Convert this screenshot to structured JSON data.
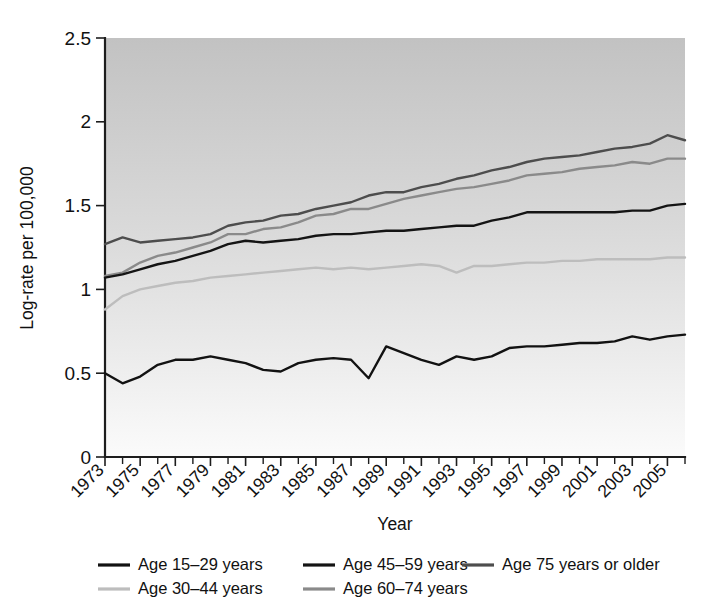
{
  "chart_data": {
    "type": "line",
    "title": "",
    "xlabel": "Year",
    "ylabel": "Log-rate per 100,000",
    "xlim": [
      1973,
      2006
    ],
    "ylim": [
      0,
      2.5
    ],
    "yticks": [
      "0",
      "0.5",
      "1",
      "1.5",
      "2",
      "2.5"
    ],
    "ytick_values": [
      0,
      0.5,
      1,
      1.5,
      2,
      2.5
    ],
    "xticks": [
      "1973",
      "1975",
      "1977",
      "1979",
      "1981",
      "1983",
      "1985",
      "1987",
      "1989",
      "1991",
      "1993",
      "1995",
      "1997",
      "1999",
      "2001",
      "2003",
      "2005"
    ],
    "xtick_values": [
      1973,
      1975,
      1977,
      1979,
      1981,
      1983,
      1985,
      1987,
      1989,
      1991,
      1993,
      1995,
      1997,
      1999,
      2001,
      2003,
      2005
    ],
    "minor_tick_interval": 1,
    "grid": false,
    "legend_position": "bottom",
    "plot_background": "vertical-gradient-gray-to-white",
    "x": [
      1973,
      1974,
      1975,
      1976,
      1977,
      1978,
      1979,
      1980,
      1981,
      1982,
      1983,
      1984,
      1985,
      1986,
      1987,
      1988,
      1989,
      1990,
      1991,
      1992,
      1993,
      1994,
      1995,
      1996,
      1997,
      1998,
      1999,
      2000,
      2001,
      2002,
      2003,
      2004,
      2005,
      2006
    ],
    "series": [
      {
        "name": "Age 15–29 years",
        "color": "#121212",
        "values": [
          0.5,
          0.44,
          0.48,
          0.55,
          0.58,
          0.58,
          0.6,
          0.58,
          0.56,
          0.52,
          0.51,
          0.56,
          0.58,
          0.59,
          0.58,
          0.47,
          0.66,
          0.62,
          0.58,
          0.55,
          0.6,
          0.58,
          0.6,
          0.65,
          0.66,
          0.66,
          0.67,
          0.68,
          0.68,
          0.69,
          0.72,
          0.7,
          0.72,
          0.73
        ]
      },
      {
        "name": "Age 30–44 years",
        "color": "#bdbdbd",
        "values": [
          0.88,
          0.96,
          1.0,
          1.02,
          1.04,
          1.05,
          1.07,
          1.08,
          1.09,
          1.1,
          1.11,
          1.12,
          1.13,
          1.12,
          1.13,
          1.12,
          1.13,
          1.14,
          1.15,
          1.14,
          1.1,
          1.14,
          1.14,
          1.15,
          1.16,
          1.16,
          1.17,
          1.17,
          1.18,
          1.18,
          1.18,
          1.18,
          1.19,
          1.19
        ]
      },
      {
        "name": "Age 45–59 years",
        "color": "#141414",
        "values": [
          1.07,
          1.09,
          1.12,
          1.15,
          1.17,
          1.2,
          1.23,
          1.27,
          1.29,
          1.28,
          1.29,
          1.3,
          1.32,
          1.33,
          1.33,
          1.34,
          1.35,
          1.35,
          1.36,
          1.37,
          1.38,
          1.38,
          1.41,
          1.43,
          1.46,
          1.46,
          1.46,
          1.46,
          1.46,
          1.46,
          1.47,
          1.47,
          1.5,
          1.51
        ]
      },
      {
        "name": "Age 60–74 years",
        "color": "#8a8a8a",
        "values": [
          1.08,
          1.1,
          1.16,
          1.2,
          1.22,
          1.25,
          1.28,
          1.33,
          1.33,
          1.36,
          1.37,
          1.4,
          1.44,
          1.45,
          1.48,
          1.48,
          1.51,
          1.54,
          1.56,
          1.58,
          1.6,
          1.61,
          1.63,
          1.65,
          1.68,
          1.69,
          1.7,
          1.72,
          1.73,
          1.74,
          1.76,
          1.75,
          1.78,
          1.78
        ]
      },
      {
        "name": "Age 75 years or older",
        "color": "#4d4d4d",
        "values": [
          1.27,
          1.31,
          1.28,
          1.29,
          1.3,
          1.31,
          1.33,
          1.38,
          1.4,
          1.41,
          1.44,
          1.45,
          1.48,
          1.5,
          1.52,
          1.56,
          1.58,
          1.58,
          1.61,
          1.63,
          1.66,
          1.68,
          1.71,
          1.73,
          1.76,
          1.78,
          1.79,
          1.8,
          1.82,
          1.84,
          1.85,
          1.87,
          1.92,
          1.89
        ]
      }
    ],
    "legend_order": [
      "Age 15–29 years",
      "Age 45–59 years",
      "Age 75 years or older",
      "Age 30–44 years",
      "Age 60–74 years"
    ]
  }
}
